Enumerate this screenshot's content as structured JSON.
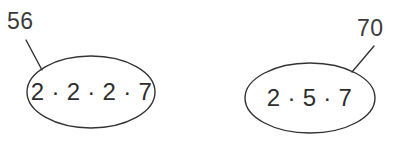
{
  "diagram": {
    "type": "prime-factorization-bubbles",
    "background_color": "#ffffff",
    "stroke_color": "#333333",
    "text_color": "#2e2e2e",
    "label_color": "#3b3b3b",
    "groups": [
      {
        "name": "fifty-six",
        "label": "56",
        "factor_expression": "2 · 2 · 2 · 7",
        "factors": [
          2,
          2,
          2,
          7
        ],
        "product": 56,
        "ellipse": {
          "cx": 91,
          "cy": 92,
          "rx": 64,
          "ry": 36
        },
        "leader_line": {
          "x1": 26,
          "y1": 40,
          "x2": 42,
          "y2": 70
        },
        "label_position": "upper-left"
      },
      {
        "name": "seventy",
        "label": "70",
        "factor_expression": "2 · 5 · 7",
        "factors": [
          2,
          5,
          7
        ],
        "product": 70,
        "ellipse": {
          "cx": 310,
          "cy": 98,
          "rx": 65,
          "ry": 35
        },
        "leader_line": {
          "x1": 374,
          "y1": 46,
          "x2": 352,
          "y2": 72
        },
        "label_position": "upper-right"
      }
    ]
  }
}
